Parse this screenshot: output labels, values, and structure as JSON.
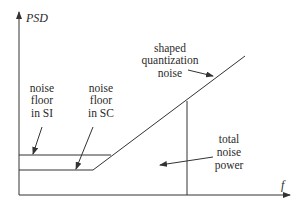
{
  "diagram": {
    "axes": {
      "y_label": "PSD",
      "x_label": "f"
    },
    "labels": {
      "shaped_quantization_noise": [
        "shaped",
        "quantization",
        "noise"
      ],
      "noise_floor_si": [
        "noise",
        "floor",
        "in SI"
      ],
      "noise_floor_sc": [
        "noise",
        "floor",
        "in SC"
      ],
      "total_noise_power": [
        "total",
        "noise",
        "power"
      ]
    },
    "colors": {
      "line": "#333333",
      "text": "#2a2a2a",
      "background": "#ffffff"
    }
  }
}
